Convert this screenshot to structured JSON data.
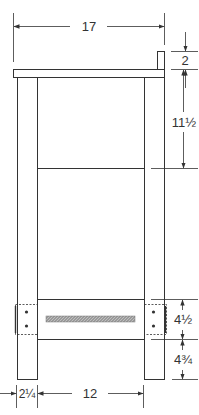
{
  "diagram": {
    "type": "technical-elevation-drawing",
    "units": "inches",
    "stroke_color": "#333333",
    "hatch_color": "#888888",
    "dimensions": {
      "overall_width": "17",
      "back_block_height": "2",
      "top_to_middle_rail": "11½",
      "lower_rail_height": "4½",
      "lower_rail_to_floor": "4¾",
      "leg_width": "2¼",
      "inner_span": "12"
    }
  }
}
